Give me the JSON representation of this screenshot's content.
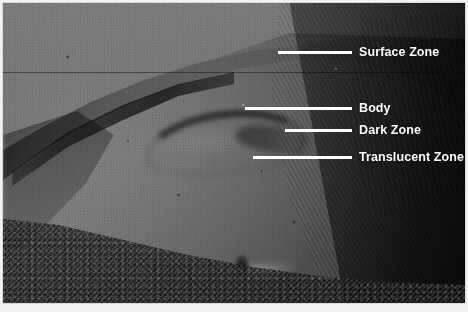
{
  "figure": {
    "type": "annotated-micrograph",
    "caption": "",
    "plate_background": "#565656",
    "annotation_color": "#ffffff"
  },
  "annotations": [
    {
      "id": "surface-zone",
      "label": "Surface Zone",
      "leader_x": 278,
      "leader_y": 51,
      "leader_width": 74,
      "label_x": 359
    },
    {
      "id": "body",
      "label": "Body",
      "leader_x": 245,
      "leader_y": 107,
      "leader_width": 107,
      "label_x": 359
    },
    {
      "id": "dark-zone",
      "label": "Dark Zone",
      "leader_x": 285,
      "leader_y": 129,
      "leader_width": 67,
      "label_x": 359
    },
    {
      "id": "translucent-zone",
      "label": "Translucent Zone",
      "leader_x": 253,
      "leader_y": 156,
      "leader_width": 99,
      "label_x": 359
    }
  ]
}
